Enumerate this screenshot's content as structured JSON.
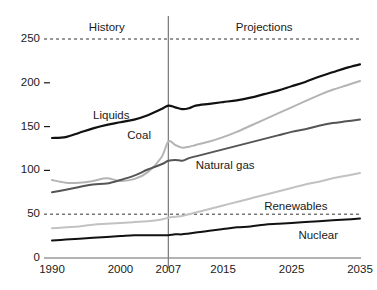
{
  "chart_data": {
    "type": "line",
    "title": "",
    "subtitle": "",
    "xlabel": "",
    "ylabel": "",
    "xlim": [
      1990,
      2035
    ],
    "ylim": [
      0,
      265
    ],
    "grid": false,
    "legend_position": "inline-annotations",
    "x_ticks": [
      "1990",
      "2000",
      "2007",
      "2015",
      "2025",
      "2035"
    ],
    "x_tick_values": [
      1990,
      2000,
      2007,
      2015,
      2025,
      2035
    ],
    "y_ticks": [
      "0",
      "50",
      "100",
      "150",
      "200",
      "250"
    ],
    "y_tick_values": [
      0,
      50,
      100,
      150,
      200,
      250
    ],
    "reference_lines": [
      {
        "value": 50,
        "style": "dashed",
        "color": "#333333"
      },
      {
        "value": 250,
        "style": "dashed",
        "color": "#333333"
      }
    ],
    "divider": {
      "x": 2007,
      "style": "solid",
      "color": "#808080"
    },
    "annotations": [
      {
        "name": "history",
        "text": "History",
        "x": 1998,
        "y": 262
      },
      {
        "name": "projections",
        "text": "Projections",
        "x": 2021,
        "y": 262
      }
    ],
    "x": [
      1990,
      1992,
      1994,
      1996,
      1998,
      2000,
      2002,
      2004,
      2006,
      2007,
      2008,
      2009,
      2010,
      2011,
      2013,
      2015,
      2017,
      2019,
      2021,
      2023,
      2025,
      2027,
      2029,
      2031,
      2033,
      2035
    ],
    "series": [
      {
        "name": "Liquids",
        "color": "#111111",
        "width": 2.2,
        "label_x": 1996,
        "label_y": 162,
        "values": [
          137,
          138,
          143,
          148,
          152,
          155,
          158,
          163,
          170,
          174,
          172,
          170,
          171,
          174,
          176,
          178,
          180,
          183,
          187,
          191,
          196,
          201,
          207,
          212,
          217,
          221
        ]
      },
      {
        "name": "Coal",
        "color": "#b4b4b4",
        "width": 2.0,
        "label_x": 2001,
        "label_y": 139,
        "values": [
          89,
          86,
          86,
          88,
          91,
          88,
          90,
          98,
          115,
          133,
          129,
          126,
          127,
          129,
          133,
          138,
          144,
          151,
          158,
          165,
          172,
          179,
          186,
          192,
          197,
          202
        ]
      },
      {
        "name": "Natural gas",
        "color": "#555555",
        "width": 2.0,
        "label_x": 2011,
        "label_y": 105,
        "values": [
          75,
          78,
          81,
          84,
          85,
          89,
          94,
          101,
          107,
          111,
          112,
          111,
          114,
          116,
          120,
          124,
          128,
          132,
          136,
          140,
          144,
          147,
          151,
          154,
          156,
          158
        ]
      },
      {
        "name": "Renewables",
        "color": "#c2c2c2",
        "width": 2.0,
        "label_x": 2021,
        "label_y": 58,
        "values": [
          34,
          35,
          36,
          38,
          39,
          40,
          41,
          42,
          44,
          46,
          47,
          48,
          50,
          52,
          56,
          60,
          64,
          68,
          72,
          76,
          80,
          84,
          87,
          91,
          94,
          97
        ]
      },
      {
        "name": "Nuclear",
        "color": "#111111",
        "width": 2.0,
        "label_x": 2026,
        "label_y": 25,
        "values": [
          20,
          21,
          22,
          23,
          24,
          25,
          26,
          26,
          26,
          26,
          27,
          27,
          28,
          29,
          31,
          33,
          35,
          36,
          38,
          39,
          40,
          41,
          42,
          43,
          44,
          45
        ]
      }
    ]
  }
}
